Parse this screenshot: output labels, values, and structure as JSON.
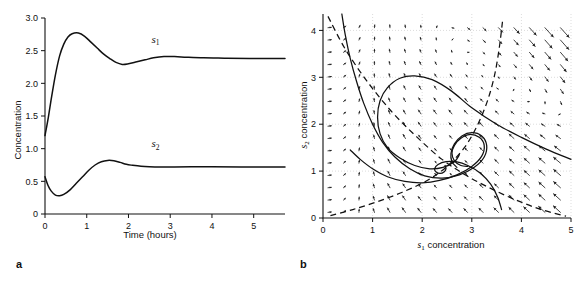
{
  "figure": {
    "panels": [
      {
        "letter": "a",
        "chart_data": {
          "type": "line",
          "title": "",
          "xlabel": "Time (hours)",
          "ylabel": "Concentration",
          "xlim": [
            0,
            5.75
          ],
          "ylim": [
            0,
            3.0
          ],
          "xticks": [
            0,
            1,
            2,
            3,
            4,
            5
          ],
          "xticklabels": [
            "0",
            "1",
            "2",
            "3",
            "4",
            "5"
          ],
          "yticks": [
            0,
            0.5,
            1.0,
            1.5,
            2.0,
            2.5,
            3.0
          ],
          "yticklabels": [
            "0",
            "0.5",
            "1.0",
            "1.5",
            "2.0",
            "2.5",
            "3.0"
          ],
          "grid": false,
          "legend_position": "inline-annotation",
          "series": [
            {
              "name": "s1",
              "label": "s",
              "label_sub": "1",
              "label_x": 2.55,
              "label_y": 2.62,
              "initial_value": 1.2,
              "peak_value": 2.77,
              "peak_time": 0.8,
              "trough_value": 2.29,
              "trough_time": 1.85,
              "steady_state": 2.38,
              "x": [
                0,
                0.08,
                0.16,
                0.25,
                0.35,
                0.45,
                0.55,
                0.65,
                0.8,
                0.95,
                1.1,
                1.25,
                1.4,
                1.55,
                1.7,
                1.85,
                2.0,
                2.2,
                2.4,
                2.6,
                2.85,
                3.1,
                3.4,
                3.8,
                4.3,
                4.9,
                5.75
              ],
              "y": [
                1.2,
                1.48,
                1.8,
                2.13,
                2.42,
                2.6,
                2.71,
                2.76,
                2.77,
                2.72,
                2.63,
                2.54,
                2.45,
                2.38,
                2.32,
                2.29,
                2.3,
                2.33,
                2.36,
                2.39,
                2.41,
                2.41,
                2.4,
                2.39,
                2.385,
                2.38,
                2.38
              ]
            },
            {
              "name": "s2",
              "label": "s",
              "label_sub": "2",
              "label_x": 2.55,
              "label_y": 1.02,
              "initial_value": 0.57,
              "trough_value": 0.28,
              "trough_time": 0.35,
              "peak_value": 0.82,
              "peak_time": 1.52,
              "steady_state": 0.72,
              "x": [
                0,
                0.07,
                0.15,
                0.25,
                0.35,
                0.45,
                0.6,
                0.75,
                0.9,
                1.05,
                1.2,
                1.35,
                1.5,
                1.65,
                1.8,
                1.95,
                2.1,
                2.3,
                2.5,
                2.75,
                3.1,
                3.5,
                4.0,
                4.7,
                5.75
              ],
              "y": [
                0.57,
                0.44,
                0.35,
                0.29,
                0.28,
                0.3,
                0.37,
                0.47,
                0.57,
                0.67,
                0.75,
                0.8,
                0.82,
                0.815,
                0.79,
                0.76,
                0.745,
                0.73,
                0.722,
                0.718,
                0.72,
                0.722,
                0.722,
                0.72,
                0.72
              ]
            }
          ]
        }
      },
      {
        "letter": "b",
        "chart_data": {
          "type": "scatter",
          "subtype": "phase-portrait-vector-field",
          "title": "",
          "xlabel": "s1 concentration",
          "xlabel_main": " concentration",
          "xlabel_italic": "s",
          "xlabel_sub": "1",
          "ylabel": "s2 concentration",
          "ylabel_main": " concentration",
          "ylabel_italic": "s",
          "ylabel_sub": "2",
          "xlim": [
            0,
            5
          ],
          "ylim": [
            0,
            4.35
          ],
          "xticks": [
            0,
            1,
            2,
            3,
            4,
            5
          ],
          "xticklabels": [
            "0",
            "1",
            "2",
            "3",
            "4",
            "5"
          ],
          "yticks": [
            0,
            1,
            2,
            3,
            4
          ],
          "yticklabels": [
            "0",
            "1",
            "2",
            "3",
            "4"
          ],
          "grid": true,
          "grid_style": "dotted",
          "fixed_point": [
            2.42,
            1.12
          ],
          "vector_field": {
            "x_start": 0.1,
            "x_step": 0.3125,
            "x_count": 16,
            "y_start": 0.12,
            "y_step": 0.2625,
            "y_count": 16,
            "description": "arrows point toward the stable spiral focus; long down-left arrows in upper right, short arrows near focus"
          },
          "nullclines": [
            {
              "name": "s1-nullcline",
              "style": "dashed",
              "points": [
                [
                  0.15,
                  0.05
                ],
                [
                  0.6,
                  0.18
                ],
                [
                  1.1,
                  0.35
                ],
                [
                  1.6,
                  0.55
                ],
                [
                  2.1,
                  0.8
                ],
                [
                  2.5,
                  1.1
                ],
                [
                  2.85,
                  1.5
                ],
                [
                  3.1,
                  1.95
                ],
                [
                  3.3,
                  2.45
                ],
                [
                  3.45,
                  3.0
                ],
                [
                  3.55,
                  3.6
                ],
                [
                  3.62,
                  4.2
                ]
              ]
            },
            {
              "name": "s2-nullcline",
              "style": "dashed",
              "points": [
                [
                  0.1,
                  4.3
                ],
                [
                  0.45,
                  3.6
                ],
                [
                  0.9,
                  2.9
                ],
                [
                  1.4,
                  2.25
                ],
                [
                  1.9,
                  1.72
                ],
                [
                  2.4,
                  1.25
                ],
                [
                  2.9,
                  0.9
                ],
                [
                  3.4,
                  0.62
                ],
                [
                  3.9,
                  0.38
                ],
                [
                  4.4,
                  0.18
                ],
                [
                  4.9,
                  0.04
                ]
              ]
            }
          ],
          "trajectories": [
            {
              "name": "trajectory-outer-from-right",
              "points": [
                [
                  5.0,
                  1.25
                ],
                [
                  4.5,
                  1.47
                ],
                [
                  4.0,
                  1.72
                ],
                [
                  3.5,
                  2.0
                ],
                [
                  3.0,
                  2.35
                ],
                [
                  2.6,
                  2.7
                ],
                [
                  2.2,
                  2.95
                ],
                [
                  1.85,
                  3.03
                ],
                [
                  1.55,
                  2.98
                ],
                [
                  1.3,
                  2.78
                ],
                [
                  1.15,
                  2.5
                ],
                [
                  1.1,
                  2.15
                ],
                [
                  1.15,
                  1.8
                ],
                [
                  1.3,
                  1.5
                ],
                [
                  1.55,
                  1.28
                ],
                [
                  1.85,
                  1.12
                ],
                [
                  2.15,
                  1.05
                ],
                [
                  2.42,
                  1.08
                ],
                [
                  2.65,
                  1.2
                ],
                [
                  2.75,
                  1.35
                ]
              ]
            },
            {
              "name": "trajectory-from-top-left",
              "points": [
                [
                  0.38,
                  4.35
                ],
                [
                  0.45,
                  3.9
                ],
                [
                  0.55,
                  3.4
                ],
                [
                  0.68,
                  2.9
                ],
                [
                  0.82,
                  2.45
                ],
                [
                  1.0,
                  2.0
                ],
                [
                  1.2,
                  1.62
                ],
                [
                  1.45,
                  1.3
                ],
                [
                  1.75,
                  1.05
                ],
                [
                  2.05,
                  0.9
                ],
                [
                  2.4,
                  0.85
                ],
                [
                  2.75,
                  0.92
                ],
                [
                  3.05,
                  1.08
                ],
                [
                  3.25,
                  1.3
                ],
                [
                  3.3,
                  1.55
                ],
                [
                  3.2,
                  1.75
                ],
                [
                  3.0,
                  1.82
                ],
                [
                  2.8,
                  1.75
                ],
                [
                  2.65,
                  1.58
                ],
                [
                  2.58,
                  1.38
                ],
                [
                  2.6,
                  1.2
                ],
                [
                  2.7,
                  1.08
                ]
              ]
            },
            {
              "name": "trajectory-lower-left",
              "points": [
                [
                  0.55,
                  1.45
                ],
                [
                  0.75,
                  1.25
                ],
                [
                  1.0,
                  1.05
                ],
                [
                  1.3,
                  0.88
                ],
                [
                  1.65,
                  0.78
                ],
                [
                  2.0,
                  0.75
                ],
                [
                  2.35,
                  0.8
                ],
                [
                  2.7,
                  0.92
                ],
                [
                  3.0,
                  1.1
                ],
                [
                  3.2,
                  1.32
                ],
                [
                  3.25,
                  1.55
                ],
                [
                  3.15,
                  1.72
                ],
                [
                  2.95,
                  1.78
                ],
                [
                  2.78,
                  1.7
                ],
                [
                  2.65,
                  1.55
                ],
                [
                  2.6,
                  1.38
                ],
                [
                  2.65,
                  1.22
                ],
                [
                  2.78,
                  1.12
                ],
                [
                  2.92,
                  1.1
                ]
              ]
            },
            {
              "name": "trajectory-from-bottom-right",
              "points": [
                [
                  3.6,
                  0.18
                ],
                [
                  3.52,
                  0.45
                ],
                [
                  3.38,
                  0.72
                ],
                [
                  3.18,
                  0.95
                ],
                [
                  2.92,
                  1.12
                ],
                [
                  2.68,
                  1.2
                ],
                [
                  2.48,
                  1.2
                ],
                [
                  2.32,
                  1.14
                ],
                [
                  2.25,
                  1.05
                ],
                [
                  2.28,
                  0.98
                ],
                [
                  2.36,
                  0.95
                ],
                [
                  2.44,
                  0.98
                ],
                [
                  2.48,
                  1.05
                ],
                [
                  2.46,
                  1.12
                ]
              ]
            }
          ]
        }
      }
    ]
  }
}
